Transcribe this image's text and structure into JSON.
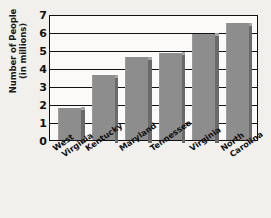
{
  "chart_data": {
    "type": "bar",
    "title": "",
    "xlabel": "",
    "ylabel_line1": "Number of People",
    "ylabel_line2": "(in millions)",
    "ylabel": "Number of People (in millions)",
    "categories": [
      "West Virginia",
      "Kentucky",
      "Maryland",
      "Tennessee",
      "Virginia",
      "North Carolina"
    ],
    "category_lines": [
      [
        "West",
        "Virginia"
      ],
      [
        "Kentucky",
        ""
      ],
      [
        "Maryland",
        ""
      ],
      [
        "Tennessee",
        ""
      ],
      [
        "Virginia",
        ""
      ],
      [
        "North",
        "Carolina"
      ]
    ],
    "values": [
      1.8,
      3.6,
      4.6,
      4.85,
      5.9,
      6.5
    ],
    "ylim": [
      0,
      7
    ],
    "yticks": [
      0,
      1,
      2,
      3,
      4,
      5,
      6,
      7
    ],
    "ytick_labels": [
      "0",
      "1",
      "2",
      "3",
      "4",
      "5",
      "6",
      "7"
    ],
    "grid": true,
    "legend": "none",
    "bar_color": "#8d8d8d",
    "bar_shadow_color": "#6a6a6a",
    "axis_color": "#111111",
    "plot_background": "#fbfaf8",
    "page_background": "#f2f0ec"
  }
}
